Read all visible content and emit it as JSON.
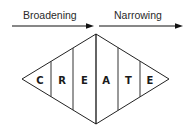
{
  "diagram": {
    "phases": [
      {
        "label": "Broadening",
        "direction": "right"
      },
      {
        "label": "Narrowing",
        "direction": "right"
      }
    ],
    "letters": [
      "C",
      "R",
      "E",
      "A",
      "T",
      "E"
    ],
    "colors": {
      "stroke": "#222222",
      "text": "#1a1a1a",
      "background": "#ffffff"
    }
  }
}
